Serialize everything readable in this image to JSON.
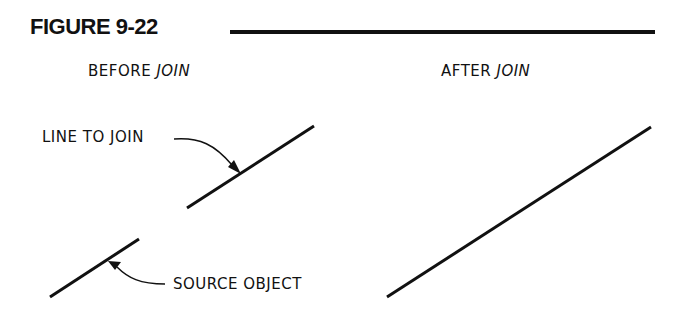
{
  "figure": {
    "title": "FIGURE 9-22"
  },
  "panels": {
    "before": {
      "heading_prefix": "BEFORE ",
      "heading_emph": "JOIN"
    },
    "after": {
      "heading_prefix": "AFTER ",
      "heading_emph": "JOIN"
    }
  },
  "callouts": {
    "line_to_join": "LINE TO JOIN",
    "source_object": "SOURCE OBJECT"
  },
  "colors": {
    "ink": "#111111",
    "background": "#ffffff"
  }
}
